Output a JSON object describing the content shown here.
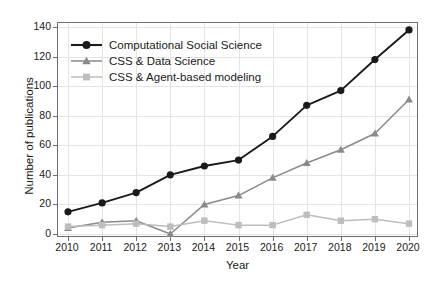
{
  "chart_data": {
    "type": "line",
    "title": "",
    "xlabel": "Year",
    "ylabel": "Number of publications",
    "categories": [
      2010,
      2011,
      2012,
      2013,
      2014,
      2015,
      2016,
      2017,
      2018,
      2019,
      2020
    ],
    "x_tick_labels": [
      "2010",
      "2011",
      "2012",
      "2013",
      "2014",
      "2015",
      "2016",
      "2017",
      "2018",
      "2019",
      "2020"
    ],
    "y_tick_labels": [
      "0",
      "20",
      "40",
      "60",
      "80",
      "100",
      "120",
      "140"
    ],
    "y_ticks": [
      0,
      20,
      40,
      60,
      80,
      100,
      120,
      140
    ],
    "ylim": [
      0,
      140
    ],
    "xlim": [
      2010,
      2020
    ],
    "grid": true,
    "legend_position": "upper-left",
    "series": [
      {
        "name": "Computational Social Science",
        "marker": "circle",
        "color": "#1a1a1a",
        "values": [
          15,
          21,
          28,
          40,
          46,
          50,
          66,
          87,
          97,
          118,
          138
        ]
      },
      {
        "name": "CSS & Data Science",
        "marker": "triangle",
        "color": "#8a8a8a",
        "values": [
          4,
          8,
          9,
          0,
          20,
          26,
          38,
          48,
          57,
          68,
          91
        ]
      },
      {
        "name": "CSS & Agent-based modeling",
        "marker": "square",
        "color": "#bdbdbd",
        "values": [
          5,
          6,
          7,
          5,
          9,
          6,
          6,
          13,
          9,
          10,
          7
        ]
      }
    ]
  },
  "legend": {
    "entries": [
      {
        "label": "Computational Social Science",
        "marker": "circle-marker",
        "color": "#1a1a1a"
      },
      {
        "label": "CSS & Data Science",
        "marker": "triangle-marker",
        "color": "#8a8a8a"
      },
      {
        "label": "CSS & Agent-based modeling",
        "marker": "square-marker",
        "color": "#bdbdbd"
      }
    ]
  },
  "colors": {
    "series_1": "#1a1a1a",
    "series_2": "#8a8a8a",
    "series_3": "#bdbdbd",
    "grid": "#e4e4e4",
    "axis": "#6e6e6e",
    "background": "#ffffff"
  }
}
